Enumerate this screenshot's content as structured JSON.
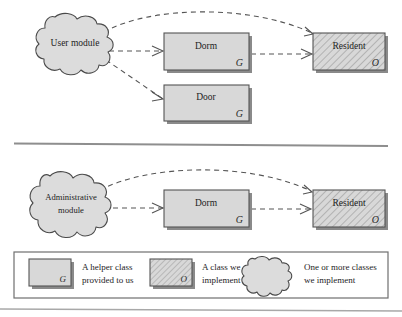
{
  "diagram": {
    "colors": {
      "box_fill": "#d8d8d8",
      "box_stroke": "#555555",
      "box_shadow": "#8a8a8a",
      "cloud_fill": "#dcdcdc",
      "cloud_stroke": "#4a4a4a",
      "hatch_stroke": "#9a9a9a",
      "arrow_stroke": "#555555",
      "separator": "#8e8e8e",
      "legend_border": "#6f6f6f",
      "background": "#ffffff"
    },
    "markers": {
      "helper": "G",
      "implement": "O"
    },
    "sections": [
      {
        "name": "user-section",
        "cloud": {
          "label": "User module",
          "lines": [
            "User module"
          ]
        },
        "boxes": [
          {
            "id": "dorm-top",
            "label": "Dorm",
            "marker": "G",
            "hatched": false
          },
          {
            "id": "door-top",
            "label": "Door",
            "marker": "G",
            "hatched": false
          },
          {
            "id": "resident-top",
            "label": "Resident",
            "marker": "O",
            "hatched": true
          }
        ],
        "edges": [
          {
            "from": "User module",
            "to": "Resident",
            "style": "dashed-curved"
          },
          {
            "from": "User module",
            "to": "Dorm",
            "style": "dashed-straight"
          },
          {
            "from": "User module",
            "to": "Door",
            "style": "dashed-straight"
          },
          {
            "from": "Dorm",
            "to": "Resident",
            "style": "dashed-straight"
          }
        ]
      },
      {
        "name": "administrative-section",
        "cloud": {
          "label": "Administrative module",
          "lines": [
            "Administrative",
            "module"
          ]
        },
        "boxes": [
          {
            "id": "dorm-bottom",
            "label": "Dorm",
            "marker": "G",
            "hatched": false
          },
          {
            "id": "resident-bottom",
            "label": "Resident",
            "marker": "O",
            "hatched": true
          }
        ],
        "edges": [
          {
            "from": "Administrative module",
            "to": "Resident",
            "style": "dashed-curved"
          },
          {
            "from": "Administrative module",
            "to": "Dorm",
            "style": "dashed-straight"
          },
          {
            "from": "Dorm",
            "to": "Resident",
            "style": "dashed-straight"
          }
        ]
      }
    ]
  },
  "legend": {
    "items": [
      {
        "swatch": "plain-box",
        "marker": "G",
        "lines": [
          "A helper class",
          "provided to us"
        ]
      },
      {
        "swatch": "hatched-box",
        "marker": "O",
        "lines": [
          "A class we",
          "implement"
        ]
      },
      {
        "swatch": "cloud",
        "marker": "",
        "lines": [
          "One or more classes",
          "we implement"
        ]
      }
    ]
  }
}
